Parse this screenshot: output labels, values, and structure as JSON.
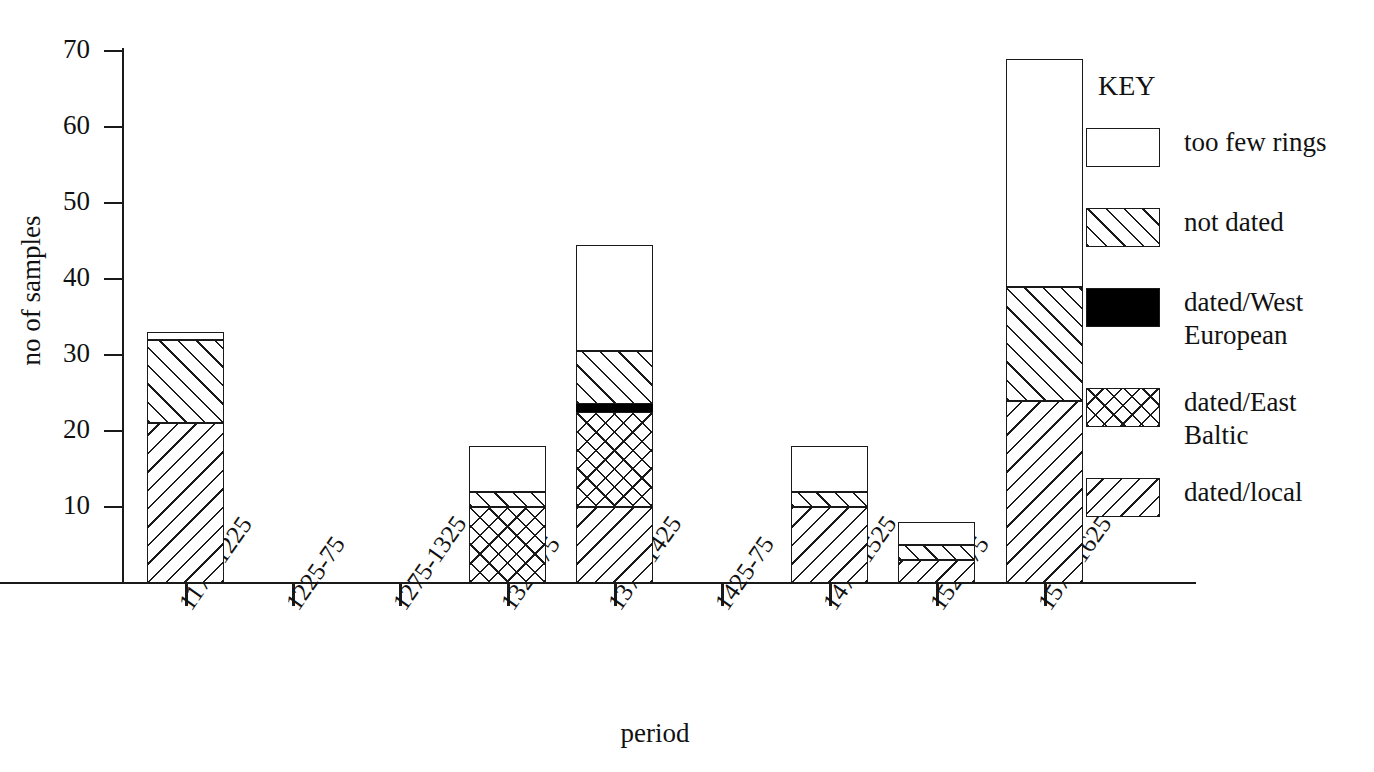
{
  "chart_data": {
    "type": "bar",
    "subtype": "stacked-bar",
    "title": "",
    "xlabel": "period",
    "ylabel": "no of samples",
    "ylim": [
      0,
      70
    ],
    "yticks": [
      0,
      10,
      20,
      30,
      40,
      50,
      60,
      70
    ],
    "ytick_labels": [
      "10",
      "20",
      "30",
      "40",
      "50",
      "60",
      "70"
    ],
    "grid": false,
    "legend_position": "right",
    "legend_title": "KEY",
    "categories": [
      "1175-1225",
      "1225-75",
      "1275-1325",
      "1325-75",
      "1375-1425",
      "1425-75",
      "1475-1525",
      "1525-75",
      "1575-1625"
    ],
    "series": [
      {
        "name": "dated/local",
        "fill": "hatch-backslash",
        "values": [
          21,
          0,
          0,
          0,
          10,
          0,
          10,
          3,
          24
        ]
      },
      {
        "name": "dated/East Baltic",
        "fill": "cross-hatch",
        "values": [
          0,
          0,
          0,
          10,
          12.5,
          0,
          0,
          0,
          0
        ]
      },
      {
        "name": "dated/West European",
        "fill": "solid-black",
        "values": [
          0,
          0,
          0,
          0,
          1,
          0,
          0,
          0,
          0
        ]
      },
      {
        "name": "not dated",
        "fill": "hatch-slash",
        "values": [
          11,
          0,
          0,
          2,
          7,
          0,
          2,
          2,
          15
        ]
      },
      {
        "name": "too few rings",
        "fill": "empty",
        "values": [
          1,
          0,
          0,
          6,
          14,
          0,
          6,
          3,
          30
        ]
      }
    ],
    "totals": [
      33,
      0,
      0,
      18,
      44.5,
      0,
      18,
      8,
      69
    ]
  },
  "legend": {
    "title": "KEY",
    "items": [
      {
        "label": "too few rings",
        "fill": "empty"
      },
      {
        "label": "not dated",
        "fill": "hatch-slash"
      },
      {
        "label": "dated/West\nEuropean",
        "fill": "solid-black"
      },
      {
        "label": "dated/East\nBaltic",
        "fill": "cross-hatch"
      },
      {
        "label": "dated/local",
        "fill": "hatch-backslash"
      }
    ]
  },
  "axes": {
    "x_label": "period",
    "y_label": "no of samples",
    "y_tick_labels": [
      "70",
      "60",
      "50",
      "40",
      "30",
      "20",
      "10"
    ],
    "x_tick_labels": [
      "1175-1225",
      "1225-75",
      "1275-1325",
      "1325-75",
      "1375-1425",
      "1425-75",
      "1475-1525",
      "1525-75",
      "1575-1625"
    ]
  },
  "colors": {
    "ink": "#1a1a1a",
    "background": "#ffffff",
    "solid_fill": "#000000"
  }
}
